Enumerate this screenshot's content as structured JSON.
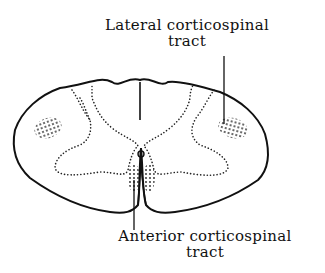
{
  "figure": {
    "labels": {
      "lateral": {
        "line1": "Lateral corticospinal",
        "line2": "tract"
      },
      "anterior": {
        "line1": "Anterior corticospinal",
        "line2": "tract"
      }
    },
    "colors": {
      "ink": "#111111",
      "background": "#ffffff"
    }
  }
}
